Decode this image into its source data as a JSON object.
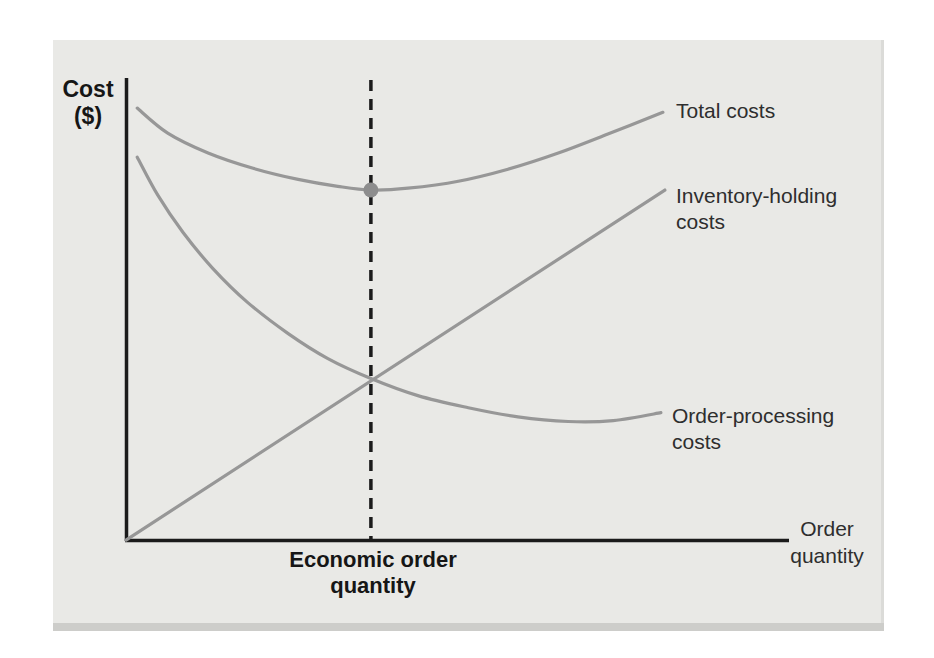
{
  "figure": {
    "y_axis_label": "Cost\n($)",
    "x_axis_label": "Order\nquantity",
    "eoq_label": "Economic order\nquantity"
  },
  "curve_labels": {
    "total": "Total costs",
    "inventory": "Inventory-holding\ncosts",
    "processing": "Order-processing\ncosts"
  },
  "colors": {
    "card_background": "#e9e9e6",
    "card_edge_shadow": "#cdcdca",
    "axis": "#1b1b1b",
    "dashed_line": "#1b1b1b",
    "curve": "#979797",
    "optimum_dot": "#8d8d8d",
    "text": "#2e2e2e"
  },
  "chart_data": {
    "type": "line",
    "xlabel": "Order quantity",
    "ylabel": "Cost ($)",
    "axes_numeric": false,
    "x_range": [
      0,
      1
    ],
    "y_range": [
      0,
      1
    ],
    "grid": false,
    "legend_position": "labels at right ends of curves",
    "series": [
      {
        "name": "Total costs",
        "points": [
          [
            0.017,
            0.935
          ],
          [
            0.063,
            0.881
          ],
          [
            0.124,
            0.838
          ],
          [
            0.192,
            0.805
          ],
          [
            0.26,
            0.781
          ],
          [
            0.32,
            0.766
          ],
          [
            0.37,
            0.758
          ],
          [
            0.426,
            0.762
          ],
          [
            0.502,
            0.777
          ],
          [
            0.577,
            0.803
          ],
          [
            0.653,
            0.838
          ],
          [
            0.728,
            0.879
          ],
          [
            0.811,
            0.926
          ]
        ]
      },
      {
        "name": "Inventory-holding costs",
        "points": [
          [
            0.0,
            0.002
          ],
          [
            0.814,
            0.758
          ]
        ]
      },
      {
        "name": "Order-processing costs",
        "points": [
          [
            0.017,
            0.829
          ],
          [
            0.048,
            0.747
          ],
          [
            0.086,
            0.667
          ],
          [
            0.131,
            0.589
          ],
          [
            0.184,
            0.515
          ],
          [
            0.245,
            0.448
          ],
          [
            0.305,
            0.394
          ],
          [
            0.37,
            0.351
          ],
          [
            0.441,
            0.314
          ],
          [
            0.517,
            0.288
          ],
          [
            0.592,
            0.268
          ],
          [
            0.668,
            0.258
          ],
          [
            0.736,
            0.26
          ],
          [
            0.808,
            0.277
          ]
        ]
      }
    ],
    "annotations": {
      "eoq_x": 0.37,
      "eoq_line_style": "dashed vertical line from top of plot to x-axis",
      "optimum_point": [
        0.37,
        0.758
      ],
      "optimum_point_note": "dot marks minimum of total costs curve at the economic order quantity",
      "curves_intersection": [
        0.37,
        0.351
      ],
      "eoq_axis_label": "Economic order quantity"
    }
  }
}
